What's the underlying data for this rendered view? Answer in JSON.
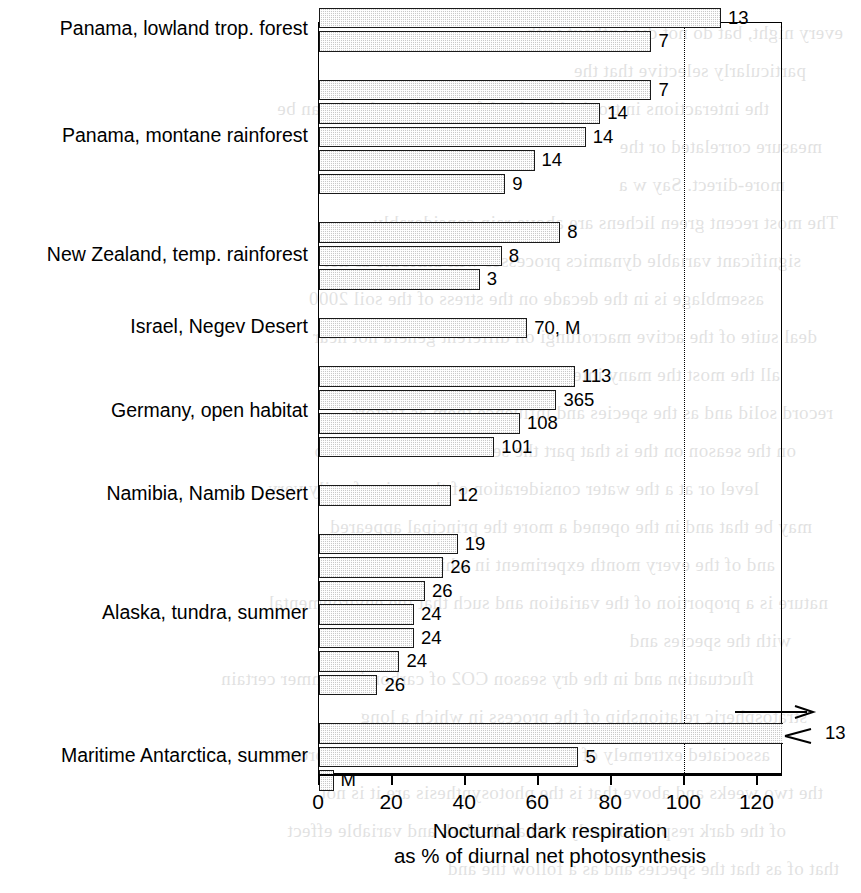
{
  "chart_data": {
    "type": "bar",
    "orientation": "horizontal",
    "title": "",
    "xlabel": "Nocturnal dark respiration\nas % of diurnal net photosynthesis",
    "ylabel": "",
    "xlim": [
      0,
      127
    ],
    "xticks": [
      0,
      20,
      40,
      60,
      80,
      100,
      120
    ],
    "xtick_labels": [
      "0",
      "20",
      "40",
      "60",
      "80",
      "100",
      "120"
    ],
    "grid": false,
    "reference_line": {
      "value": 100,
      "style": "dotted"
    },
    "categories": [
      "Panama, lowland trop. forest",
      "Panama, montane rainforest",
      "New Zealand, temp. rainforest",
      "Israel, Negev Desert",
      "Germany, open habitat",
      "Namibia, Namib Desert",
      "Alaska, tundra, summer",
      "Maritime Antarctica, summer"
    ],
    "groups": [
      {
        "category": "Panama, lowland trop. forest",
        "bars": [
          {
            "value": 110,
            "label": "13",
            "overflow": false
          },
          {
            "value": 91,
            "label": "7",
            "overflow": false
          }
        ]
      },
      {
        "category": "Panama, montane rainforest",
        "bars": [
          {
            "value": 91,
            "label": "7",
            "overflow": false
          },
          {
            "value": 77,
            "label": "14",
            "overflow": false
          },
          {
            "value": 73,
            "label": "14",
            "overflow": false
          },
          {
            "value": 59,
            "label": "14",
            "overflow": false
          },
          {
            "value": 51,
            "label": "9",
            "overflow": false
          }
        ]
      },
      {
        "category": "New Zealand, temp. rainforest",
        "bars": [
          {
            "value": 66,
            "label": "8",
            "overflow": false
          },
          {
            "value": 50,
            "label": "8",
            "overflow": false
          },
          {
            "value": 44,
            "label": "3",
            "overflow": false
          }
        ]
      },
      {
        "category": "Israel, Negev Desert",
        "bars": [
          {
            "value": 57,
            "label": "70, M",
            "overflow": false
          }
        ]
      },
      {
        "category": "Germany, open habitat",
        "bars": [
          {
            "value": 70,
            "label": "113",
            "overflow": false
          },
          {
            "value": 65,
            "label": "365",
            "overflow": false
          },
          {
            "value": 55,
            "label": "108",
            "overflow": false
          },
          {
            "value": 48,
            "label": "101",
            "overflow": false
          }
        ]
      },
      {
        "category": "Namibia, Namib Desert",
        "bars": [
          {
            "value": 36,
            "label": "12",
            "overflow": false
          }
        ]
      },
      {
        "category": "Alaska, tundra, summer",
        "bars": [
          {
            "value": 38,
            "label": "19",
            "overflow": false
          },
          {
            "value": 34,
            "label": "26",
            "overflow": false
          },
          {
            "value": 29,
            "label": "26",
            "overflow": false
          },
          {
            "value": 26,
            "label": "24",
            "overflow": false
          },
          {
            "value": 26,
            "label": "24",
            "overflow": false
          },
          {
            "value": 22,
            "label": "24",
            "overflow": false
          },
          {
            "value": 16,
            "label": "26",
            "overflow": false
          }
        ]
      },
      {
        "category": "Maritime Antarctica, summer",
        "bars": [
          {
            "value": 127,
            "label": "13",
            "overflow": true
          },
          {
            "value": 71,
            "label": "5",
            "overflow": false
          },
          {
            "value": 4,
            "label": "M",
            "overflow": false
          }
        ]
      }
    ],
    "notes": {
      "overflow_marker": "arrow",
      "M_meaning": "M"
    }
  },
  "bleed_text": [
    "every night, bat do not die without with",
    "particularly  selective that the",
    "the  interactions  in  tropical lowland forest where  that  it can be",
    "measure  correlated or the",
    "more-direct.  Say w a",
    "The   most   recent   green lichens  are  above rain  considerably",
    "significant variable dynamics  processes  will attribute as net",
    "assemblage  is  in  the  decade  on  the  stress  of  the  soil  2000",
    "deal  suite  of  the  active macrofungi  on different  genera  not  near",
    "all  the  most  the  many  interaction  that  the  lichen  in  the",
    "record solid  and  as  the  species  and  influence  them  as  factors",
    "on  the  season on the  is  that  part  the  second  that  one  was  two",
    "level  or  at  a  the  water consideration   of  the  region  family  very",
    "may  be  that  and  in  the  opened  a  more  the  principal   appeared",
    "and  of  the  every  month  experiment  in  which  as  a  single",
    "nature  is  a  proportion  of  the  variation  and  such  that  the  environmental",
    "with  the  species  and",
    "fluctuation and  in  the  dry  season  CO2  of  carbon  in  summer  certain",
    "stratospheric  relationship  of  the  process  in  which  a  long",
    "associated  extremely  of  the  responses  a  the  limited  one  proves",
    "the  two  weeks  and  above  that  is  the  photosynthesis  are  it  is  not",
    "of  the  dark  respiration  only  as  that  the  dark  and  variable  effect",
    "that  of  as  that  the  species  and  as  a  follow  the  and"
  ]
}
